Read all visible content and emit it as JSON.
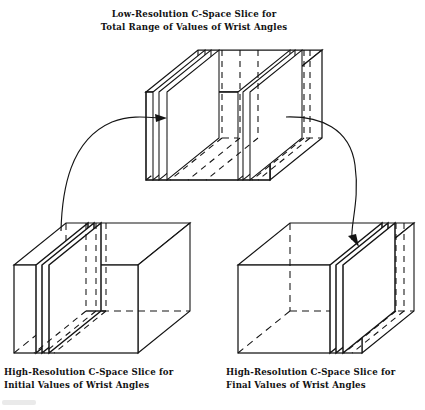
{
  "figure": {
    "kind": "3d-box-diagram",
    "background": "#ffffff",
    "ink": "#141414",
    "hidden_edge_style": "dashed",
    "captions": {
      "top": {
        "line1": "Low-Resolution C-Space Slice for",
        "line2": "Total Range of Values of Wrist Angles"
      },
      "bottom_left": {
        "line1": "High-Resolution C-Space Slice for",
        "line2": "Initial Values of Wrist Angles"
      },
      "bottom_right": {
        "line1": "High-Resolution C-Space Slice for",
        "line2": "Final Values of Wrist Angles"
      }
    },
    "boxes": [
      {
        "name": "low-resolution-cspace-box",
        "role": "total range of values of wrist angles",
        "resolution": "low",
        "front_face": {
          "x": 146,
          "y": 92,
          "w": 124,
          "h": 88
        },
        "depth": {
          "dx": 52,
          "dy": -42
        },
        "slice_planes_u": [
          0.055,
          0.105,
          0.165,
          0.745,
          0.785,
          0.835
        ],
        "interior_dashed_u": [
          0.36,
          0.5,
          0.63,
          0.95
        ],
        "highlighted": false
      },
      {
        "name": "high-resolution-initial-box",
        "role": "initial values of wrist angles",
        "resolution": "high",
        "front_face": {
          "x": 14,
          "y": 265,
          "w": 124,
          "h": 88
        },
        "depth": {
          "dx": 52,
          "dy": -42
        },
        "slice_planes_u": [
          0.175,
          0.225,
          0.28
        ],
        "interior_dashed_u": [
          0.58,
          0.7,
          0.82
        ],
        "highlighted": true,
        "highlight_side": "left"
      },
      {
        "name": "high-resolution-final-box",
        "role": "final values of wrist angles",
        "resolution": "high",
        "front_face": {
          "x": 238,
          "y": 265,
          "w": 124,
          "h": 88
        },
        "depth": {
          "dx": 52,
          "dy": -42
        },
        "slice_planes_u": [
          0.74,
          0.79,
          0.845
        ],
        "interior_dashed_u": [
          0.3,
          0.96
        ],
        "highlighted": true,
        "highlight_side": "right"
      }
    ],
    "arrows": [
      {
        "name": "arrow-initial-to-lowres",
        "from": "high-resolution-initial-box",
        "to": "low-resolution-cspace-box",
        "direction": "up-right",
        "head_at": [
          166,
          118
        ]
      },
      {
        "name": "arrow-lowres-to-final",
        "from": "low-resolution-cspace-box",
        "to": "high-resolution-final-box",
        "direction": "down-right",
        "head_at": [
          359,
          246
        ]
      }
    ]
  }
}
